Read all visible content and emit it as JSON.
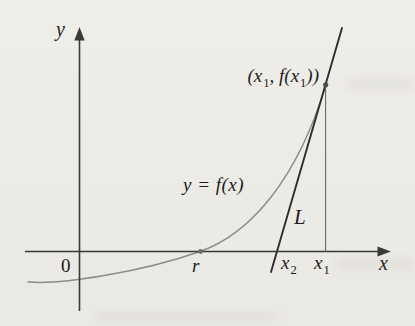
{
  "labels": {
    "y_axis": "y",
    "x_axis": "x",
    "origin": "0",
    "root": "r",
    "curve": "y = f(x)",
    "tangent_line": "L",
    "x2": {
      "base": "x",
      "sub": "2"
    },
    "x1": {
      "base": "x",
      "sub": "1"
    },
    "tangent_point": {
      "open": "(x",
      "sub1": "1",
      "mid": ", f(x",
      "sub2": "1",
      "close": "))"
    }
  },
  "colors": {
    "background": "#f3f1ec",
    "axis": "#3b3b3b",
    "curve": "#8f8f8f",
    "tangent": "#2e2e2e",
    "drop_line": "#6a6a6a",
    "root_dot": "#6f6f6f",
    "tangent_dot": "#4f4f4f",
    "text": "#1c1c1c"
  },
  "geometry": {
    "x_axis": {
      "x1": 25,
      "y1": 251.5,
      "x2": 380,
      "y2": 251.5
    },
    "x_axis_arrow": "391,251.5 377.5,246.5 377.5,256.5",
    "y_axis": {
      "x1": 79.5,
      "y1": 311,
      "x2": 79.5,
      "y2": 40
    },
    "y_axis_arrow": "79.5,27 74.3,40.5 84.7,40.5",
    "curve_path": "M 28 282 C 60 285, 142 272, 200 251.5 C 250 234, 297 180, 326 84.5",
    "tangent_line": {
      "x1": 342,
      "y1": 28,
      "x2": 271,
      "y2": 272
    },
    "drop_line": {
      "x1": 325.6,
      "y1": 85,
      "x2": 325.6,
      "y2": 251.5
    },
    "root_dot": {
      "cx": 200.5,
      "cy": 251.5,
      "r": 2.4
    },
    "tangent_dot": {
      "cx": 325.7,
      "cy": 84.8,
      "r": 2.6
    }
  }
}
